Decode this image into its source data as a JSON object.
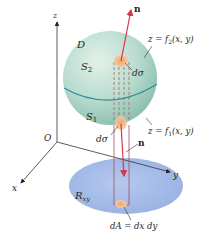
{
  "figure": {
    "axes": {
      "z_label": "z",
      "x_label": "x",
      "y_label": "y",
      "origin_label": "O"
    },
    "region_labels": {
      "solid": "D",
      "upper_surface": "S",
      "upper_surface_sub": "2",
      "lower_surface": "S",
      "lower_surface_sub": "1",
      "projection": "R",
      "projection_sub": "xy"
    },
    "surface_equations": {
      "upper": {
        "prefix": "z = f",
        "sub": "2",
        "suffix": "(x, y)"
      },
      "lower": {
        "prefix": "z = f",
        "sub": "1",
        "suffix": "(x, y)"
      }
    },
    "elements": {
      "upper_patch": "dσ",
      "lower_patch": "dσ",
      "area_element": "dA = dx dy",
      "upper_normal": "n",
      "lower_normal": "n"
    },
    "colors": {
      "sphere_light": "#d6ebe2",
      "sphere_dark": "#8fc2b2",
      "equator": "#2e8f94",
      "region": "#a9bfe8",
      "patch": "#f2b27c",
      "normal_arrow": "#d8364a",
      "column": "#a0505e",
      "axis": "#333333"
    }
  }
}
